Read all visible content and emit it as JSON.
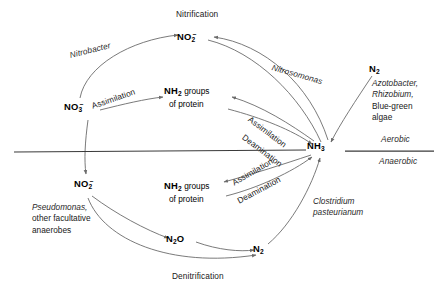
{
  "diagram": {
    "stroke_color": "#6b6b6b",
    "line_color": "#3a3a3a",
    "text_color": "#202020",
    "background": "#ffffff",
    "divider": {
      "aerobic_label": "Aerobic",
      "anaerobic_label": "Anaerobic"
    },
    "nodes": [
      {
        "id": "nitrite-top",
        "formula": "NO",
        "sub": "2",
        "sup": "−",
        "x": 190,
        "y": 38
      },
      {
        "id": "nitrate",
        "formula": "NO",
        "sub": "3",
        "sup": "−",
        "x": 75,
        "y": 108
      },
      {
        "id": "nh2-upper",
        "formula": "NH",
        "sub": "2",
        "sup": "",
        "suffix": " groups",
        "line2": "of protein",
        "x": 168,
        "y": 92
      },
      {
        "id": "ammonia",
        "formula": "NH",
        "sub": "3",
        "sup": "",
        "x": 313,
        "y": 147
      },
      {
        "id": "dinitrogen-top",
        "formula": "N",
        "sub": "2",
        "sup": "",
        "x": 375,
        "y": 70
      },
      {
        "id": "nitrite-bottom",
        "formula": "NO",
        "sub": "2",
        "sup": "−",
        "x": 85,
        "y": 185
      },
      {
        "id": "nh2-lower",
        "formula": "NH",
        "sub": "2",
        "sup": "",
        "suffix": " groups",
        "line2": "of protein",
        "x": 168,
        "y": 186
      },
      {
        "id": "nitrous-oxide",
        "formula": "N",
        "sub": "2",
        "sup": "",
        "suffix2": "O",
        "x": 172,
        "y": 240
      },
      {
        "id": "dinitrogen-bot",
        "formula": "N",
        "sub": "2",
        "sup": "",
        "x": 258,
        "y": 248
      }
    ],
    "process_labels": [
      {
        "id": "nitrification",
        "text": "Nitrification",
        "style": "plain",
        "x": 176,
        "y": 14,
        "rotate": 0
      },
      {
        "id": "denitrification",
        "text": "Denitrification",
        "style": "plain",
        "x": 172,
        "y": 276,
        "rotate": 0
      },
      {
        "id": "assimilation-1",
        "text": "Assimilation",
        "style": "plain",
        "x": 92,
        "y": 101,
        "rotate": -19
      },
      {
        "id": "assimilation-2",
        "text": "Assimilation",
        "style": "plain",
        "x": 249,
        "y": 113,
        "rotate": 37
      },
      {
        "id": "deamination-1",
        "text": "Deamination",
        "style": "plain",
        "x": 243,
        "y": 131,
        "rotate": 37
      },
      {
        "id": "assimilation-3",
        "text": "Assimilation",
        "style": "plain",
        "x": 233,
        "y": 178,
        "rotate": -30
      },
      {
        "id": "deamination-2",
        "text": "Deamination",
        "style": "plain",
        "x": 238,
        "y": 196,
        "rotate": -28
      }
    ],
    "organism_labels": [
      {
        "id": "nitrobacter",
        "text": "Nitrobacter",
        "x": 70,
        "y": 50,
        "rotate": -14
      },
      {
        "id": "nitrosomonas",
        "text": "Nitrosomonas",
        "x": 272,
        "y": 62,
        "rotate": 16
      },
      {
        "id": "clostridium",
        "line1": "Clostridium",
        "line2": "pasteurianum",
        "x": 313,
        "y": 196
      }
    ],
    "nitrogen_fixers": {
      "items": [
        {
          "text": "Azotobacter,",
          "italic": true
        },
        {
          "text": "Rhizobium,",
          "italic": true
        },
        {
          "text": "Blue-green",
          "italic": false
        },
        {
          "text": "algae",
          "italic": false
        }
      ],
      "x": 372,
      "y": 83
    },
    "denitrifiers": {
      "items": [
        {
          "text": "Pseudomonas,",
          "italic": true
        },
        {
          "text": "other facultative",
          "italic": false
        },
        {
          "text": "anaerobes",
          "italic": false
        }
      ],
      "x": 32,
      "y": 206
    }
  }
}
